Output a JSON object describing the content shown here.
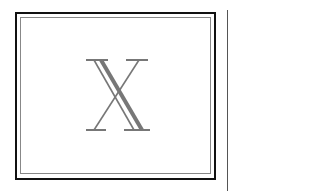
{
  "frame": {
    "glyph": "X",
    "glyph_color": "#777777",
    "outer_border_color": "#111111",
    "inner_border_color": "#888888"
  },
  "divider": {
    "color": "#555555"
  }
}
